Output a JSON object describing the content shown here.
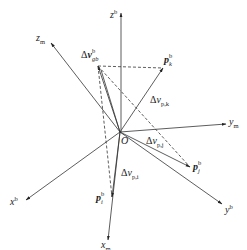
{
  "figure": {
    "origin_label": "O",
    "axes": {
      "z_b": {
        "base": "z",
        "sup": "b"
      },
      "z_m": {
        "base": "z",
        "sub": "m"
      },
      "y_m": {
        "base": "y",
        "sub": "m"
      },
      "y_b": {
        "base": "y",
        "sup": "b"
      },
      "x_b": {
        "base": "x",
        "sup": "b"
      },
      "x_m": {
        "base": "x",
        "sub": "m"
      }
    },
    "vectors": {
      "dv_gb": {
        "prefix": "Δ",
        "base": "v",
        "sup": "b",
        "sub": "gb"
      },
      "p_k": {
        "base": "p",
        "sup": "b",
        "sub": "k"
      },
      "p_j": {
        "base": "p",
        "sup": "b",
        "sub": "j"
      },
      "p_i": {
        "base": "p",
        "sup": "b",
        "sub": "i"
      },
      "dv_pk": {
        "prefix": "Δ",
        "base": "v",
        "sub": "p,k"
      },
      "dv_pj": {
        "prefix": "Δ",
        "base": "v",
        "sub": "p,j"
      },
      "dv_pi": {
        "prefix": "Δ",
        "base": "v",
        "sub": "p,i"
      }
    },
    "line_color": "#333333"
  }
}
